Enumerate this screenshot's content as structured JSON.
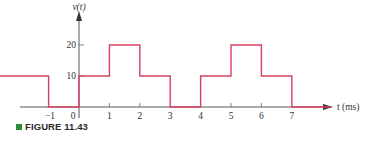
{
  "figure": {
    "caption_label": "FIGURE 11.43",
    "caption_marker_color": "#2e8b3a"
  },
  "chart_data": {
    "type": "line",
    "title": "",
    "xlabel": "t (ms)",
    "ylabel": "v(t)",
    "style": "step waveform (periodic pulse train)",
    "x_ticks": [
      -1,
      0,
      1,
      2,
      3,
      4,
      5,
      6,
      7
    ],
    "y_ticks": [
      10,
      20
    ],
    "xlim": [
      -2.6,
      8.3
    ],
    "ylim": [
      0,
      30
    ],
    "grid": false,
    "line_color": "#d8405f",
    "axis_color": "#444444",
    "series": [
      {
        "name": "v(t)",
        "steps": [
          {
            "t_start": -2.6,
            "t_end": -1,
            "value": 10
          },
          {
            "t_start": -1,
            "t_end": 0,
            "value": 0
          },
          {
            "t_start": 0,
            "t_end": 1,
            "value": 10
          },
          {
            "t_start": 1,
            "t_end": 2,
            "value": 20
          },
          {
            "t_start": 2,
            "t_end": 3,
            "value": 10
          },
          {
            "t_start": 3,
            "t_end": 4,
            "value": 0
          },
          {
            "t_start": 4,
            "t_end": 5,
            "value": 10
          },
          {
            "t_start": 5,
            "t_end": 6,
            "value": 20
          },
          {
            "t_start": 6,
            "t_end": 7,
            "value": 10
          },
          {
            "t_start": 7,
            "t_end": 8.3,
            "value": 0
          }
        ]
      }
    ]
  }
}
